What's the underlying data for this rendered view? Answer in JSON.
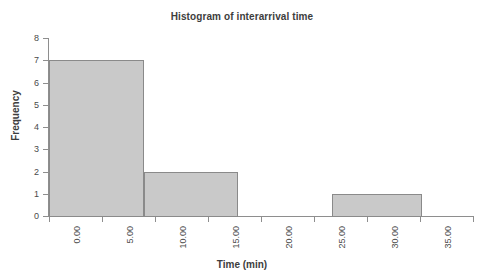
{
  "chart_data": {
    "type": "bar",
    "title": "Histogram of interarrival time",
    "xlabel": "Time (min)",
    "ylabel": "Frequency",
    "xlim": [
      0,
      40
    ],
    "ylim": [
      0,
      8
    ],
    "grid": false,
    "legend": null,
    "xticks": [
      0,
      5,
      10,
      15,
      20,
      25,
      30,
      35,
      40
    ],
    "xtick_labels": [
      "0.00",
      "5.00",
      "10.00",
      "15.00",
      "20.00",
      "25.00",
      "30.00",
      "35.00",
      "40.00"
    ],
    "yticks": [
      0,
      1,
      2,
      3,
      4,
      5,
      6,
      7,
      8
    ],
    "ytick_labels": [
      "0",
      "1",
      "2",
      "3",
      "4",
      "5",
      "6",
      "7",
      "8"
    ],
    "bin_edges": [
      0.0,
      8.95,
      17.85,
      26.7,
      35.2
    ],
    "bars": [
      {
        "label": "0.00-8.95",
        "x0": 0.0,
        "x1": 8.95,
        "value": 7
      },
      {
        "label": "8.95-17.85",
        "x0": 8.95,
        "x1": 17.85,
        "value": 2
      },
      {
        "label": "26.70-35.20",
        "x0": 26.7,
        "x1": 35.2,
        "value": 1
      }
    ],
    "categories": [
      "0.00-8.95",
      "8.95-17.85",
      "26.70-35.20"
    ],
    "values": [
      7,
      2,
      1
    ],
    "colors": {
      "bar_fill": "#c9c9c9",
      "bar_border": "#8a8a8a",
      "axis": "#8e8e8e",
      "text": "#3d3d3d",
      "background": "#ffffff"
    }
  }
}
